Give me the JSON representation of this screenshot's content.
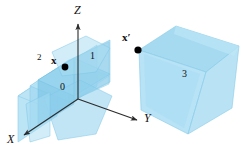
{
  "figure": {
    "background": "#ffffff"
  },
  "colors": {
    "cube_fill": "#a8dcf2",
    "cube_fill_mid": "#8ecdea",
    "cube_fill_dark": "#6fbfe0",
    "cube_edge": "#7ec8e8",
    "axis": "#2b2b2b",
    "label": "#111111",
    "point": "#000000"
  },
  "axes": {
    "origin": {
      "x": 78,
      "y": 99
    },
    "items": [
      {
        "name": "z-axis",
        "label": "Z",
        "label_x": 74,
        "label_y": 6,
        "x1": 78,
        "y1": 99,
        "x2": 78,
        "y2": 22
      },
      {
        "name": "y-axis",
        "label": "Y",
        "label_x": 144,
        "label_y": 113,
        "x1": 78,
        "y1": 99,
        "x2": 139,
        "y2": 121
      },
      {
        "name": "x-axis",
        "label": "X",
        "label_x": 7,
        "label_y": 134,
        "x1": 78,
        "y1": 99,
        "x2": 22,
        "y2": 137
      }
    ]
  },
  "points": [
    {
      "name": "point-x",
      "label": "x",
      "label_x": 51,
      "label_y": 56,
      "cx": 65,
      "cy": 67,
      "r": 3.4
    },
    {
      "name": "point-x-prime",
      "label": "x′",
      "label_x": 122,
      "label_y": 33,
      "cx": 138,
      "cy": 50,
      "r": 3.6
    }
  ],
  "region_labels": [
    {
      "name": "region-label-2",
      "text": "2",
      "x": 37,
      "y": 54
    },
    {
      "name": "region-label-1",
      "text": "1",
      "x": 90,
      "y": 52
    },
    {
      "name": "region-label-0",
      "text": "0",
      "x": 60,
      "y": 83
    },
    {
      "name": "region-label-3",
      "text": "3",
      "x": 182,
      "y": 70
    }
  ],
  "shapes": {
    "left_cube": {
      "name": "origin-cube",
      "description": "translucent blue cube centered on the origin, overlapping faces"
    },
    "right_cube": {
      "name": "transformed-cube",
      "description": "translucent blue cube displaced to the right, labeled 3"
    }
  }
}
